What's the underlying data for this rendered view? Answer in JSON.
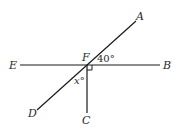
{
  "diagram": {
    "points": {
      "A": "A",
      "B": "B",
      "C": "C",
      "D": "D",
      "E": "E",
      "F": "F"
    },
    "angles": {
      "AFB": "40°",
      "DFC": "x°"
    },
    "lines": [
      "EB",
      "AD",
      "FC"
    ],
    "right_angle_at": "F (between FB and FC)"
  }
}
